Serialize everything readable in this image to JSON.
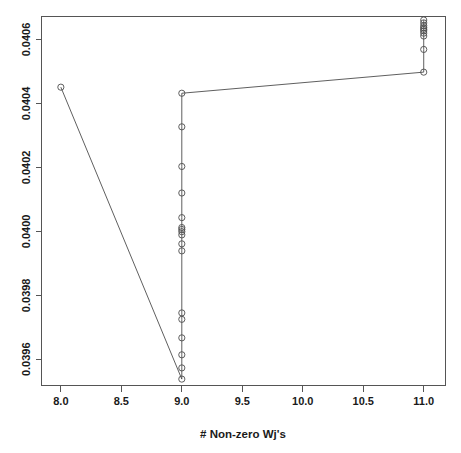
{
  "figure": {
    "width": 461,
    "height": 453,
    "background": "#ffffff",
    "foreground": "#4d4d4d",
    "axis_color": "#555555",
    "text_color": "#1a1a1a"
  },
  "chart_data": {
    "type": "line",
    "title": "",
    "subtitle": "",
    "xlabel": "# Non-zero Wj's",
    "ylabel": "",
    "xlim": [
      7.84,
      11.18
    ],
    "ylim": [
      0.039518,
      0.040672
    ],
    "grid": false,
    "legend": null,
    "marker": "open-circle",
    "xticks": [
      8.0,
      8.5,
      9.0,
      9.5,
      10.0,
      10.5,
      11.0
    ],
    "xtick_labels": [
      "8.0",
      "8.5",
      "9.0",
      "9.5",
      "10.0",
      "10.5",
      "11.0"
    ],
    "yticks": [
      0.0396,
      0.0398,
      0.04,
      0.0402,
      0.0404,
      0.0406
    ],
    "ytick_labels": [
      "0.0396",
      "0.0398",
      "0.0400",
      "0.0402",
      "0.0404",
      "0.0406"
    ],
    "series": [
      {
        "name": "path",
        "x": [
          8.0,
          9.0,
          9.0,
          9.0,
          9.0,
          9.0,
          9.0,
          9.0,
          9.0,
          9.0,
          9.0,
          9.0,
          9.0,
          9.0,
          9.0,
          9.0,
          9.0,
          9.0,
          9.0,
          9.0,
          11.0,
          11.0,
          11.0,
          11.0,
          11.0,
          11.0,
          11.0,
          11.0,
          11.0,
          11.0
        ],
        "y": [
          0.040451,
          0.039538,
          0.039573,
          0.039614,
          0.039667,
          0.039725,
          0.039745,
          0.039939,
          0.039961,
          0.039989,
          0.039999,
          0.040006,
          0.040012,
          0.040043,
          0.04012,
          0.040203,
          0.040327,
          0.040432,
          0.040432,
          0.040432,
          0.040498,
          0.040569,
          0.040611,
          0.04062,
          0.040627,
          0.040632,
          0.040637,
          0.040643,
          0.040652,
          0.040661
        ]
      }
    ],
    "points": [
      {
        "x": 8.0,
        "y": 0.040451
      },
      {
        "x": 9.0,
        "y": 0.040432
      },
      {
        "x": 9.0,
        "y": 0.040327
      },
      {
        "x": 9.0,
        "y": 0.040203
      },
      {
        "x": 9.0,
        "y": 0.04012
      },
      {
        "x": 9.0,
        "y": 0.040043
      },
      {
        "x": 9.0,
        "y": 0.040012
      },
      {
        "x": 9.0,
        "y": 0.040006
      },
      {
        "x": 9.0,
        "y": 0.039999
      },
      {
        "x": 9.0,
        "y": 0.039989
      },
      {
        "x": 9.0,
        "y": 0.039961
      },
      {
        "x": 9.0,
        "y": 0.039939
      },
      {
        "x": 9.0,
        "y": 0.039745
      },
      {
        "x": 9.0,
        "y": 0.039725
      },
      {
        "x": 9.0,
        "y": 0.039667
      },
      {
        "x": 9.0,
        "y": 0.039614
      },
      {
        "x": 9.0,
        "y": 0.039573
      },
      {
        "x": 9.0,
        "y": 0.039538
      },
      {
        "x": 11.0,
        "y": 0.040498
      },
      {
        "x": 11.0,
        "y": 0.040569
      },
      {
        "x": 11.0,
        "y": 0.040611
      },
      {
        "x": 11.0,
        "y": 0.04062
      },
      {
        "x": 11.0,
        "y": 0.040627
      },
      {
        "x": 11.0,
        "y": 0.040632
      },
      {
        "x": 11.0,
        "y": 0.040637
      },
      {
        "x": 11.0,
        "y": 0.040643
      },
      {
        "x": 11.0,
        "y": 0.040652
      },
      {
        "x": 11.0,
        "y": 0.040661
      }
    ]
  }
}
